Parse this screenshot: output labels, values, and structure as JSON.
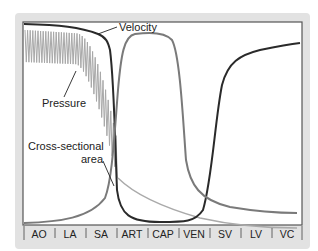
{
  "chart_data": {
    "type": "line",
    "title": "",
    "xlabel": "",
    "ylabel": "",
    "categories": [
      "AO",
      "LA",
      "SA",
      "ART",
      "CAP",
      "VEN",
      "SV",
      "LV",
      "VC"
    ],
    "grid": false,
    "legend": "inline annotations",
    "series": [
      {
        "name": "Velocity",
        "color": "#2a2a2a",
        "note": "high in AO/LA/SA, drops to minimum at CAP, rises through VEN/SV, high in LV/VC"
      },
      {
        "name": "Pressure",
        "color": "#a8a8a8",
        "note": "pulsatile high in AO-LA, declines through SA, low after ART, near zero in VEN-VC"
      },
      {
        "name": "Cross-sectional area",
        "color": "#7a7a7a",
        "note": "low in AO-SA, steep rise at ART, peak at CAP, falls in VEN/SV, low in LV/VC"
      }
    ],
    "annotations": [
      "Velocity",
      "Pressure",
      "Cross-sectional area"
    ]
  },
  "labels": {
    "velocity": "Velocity",
    "pressure": "Pressure",
    "area_line1": "Cross-sectional",
    "area_line2": "area"
  },
  "axis": {
    "ticks": [
      "AO",
      "LA",
      "SA",
      "ART",
      "CAP",
      "VEN",
      "SV",
      "LV",
      "VC"
    ]
  },
  "colors": {
    "frame": "#e2e2e2",
    "plot_bg": "#ffffff",
    "velocity": "#2a2a2a",
    "area": "#7a7a7a",
    "pressure": "#a8a8a8"
  }
}
